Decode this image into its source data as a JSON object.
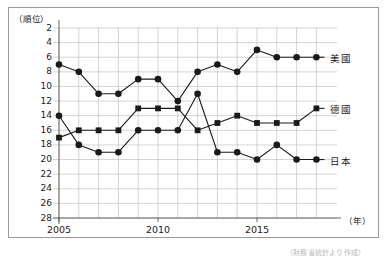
{
  "figure": {
    "y_axis_unit": "（順位）",
    "x_axis_unit": "（年）",
    "source_note": "（財務省統計より作成）"
  },
  "chart_data": {
    "type": "line",
    "title": "",
    "xlabel": "（年）",
    "ylabel": "（順位）",
    "x": [
      2005,
      2006,
      2007,
      2008,
      2009,
      2010,
      2011,
      2012,
      2013,
      2014,
      2015,
      2016,
      2017,
      2018
    ],
    "xtick_labels": [
      "2005",
      "2010",
      "2015"
    ],
    "xticks": [
      2005,
      2010,
      2015
    ],
    "xlim": [
      2004,
      2018.6
    ],
    "ytick_labels": [
      "2",
      "4",
      "6",
      "8",
      "10",
      "12",
      "14",
      "16",
      "18",
      "20",
      "22",
      "24",
      "26",
      "28"
    ],
    "yticks": [
      2,
      4,
      6,
      8,
      10,
      12,
      14,
      16,
      18,
      20,
      22,
      24,
      26,
      28
    ],
    "ylim": [
      1,
      29
    ],
    "y_axis_inverted": true,
    "grid": true,
    "legend_position": "right-inline",
    "series": [
      {
        "name": "美國",
        "marker": "circle",
        "color": "#1a1a1a",
        "label_y_value": 6,
        "values": [
          7,
          8,
          11,
          11,
          9,
          9,
          12,
          8,
          7,
          8,
          5,
          6,
          6,
          6
        ]
      },
      {
        "name": "德國",
        "marker": "square",
        "color": "#1a1a1a",
        "label_y_value": 13,
        "values": [
          17,
          16,
          16,
          16,
          13,
          13,
          13,
          16,
          15,
          14,
          15,
          15,
          15,
          13
        ]
      },
      {
        "name": "日本",
        "marker": "circle",
        "color": "#1a1a1a",
        "label_y_value": 20,
        "values": [
          14,
          18,
          19,
          19,
          16,
          16,
          16,
          11,
          19,
          19,
          20,
          18,
          20,
          20
        ]
      }
    ]
  }
}
